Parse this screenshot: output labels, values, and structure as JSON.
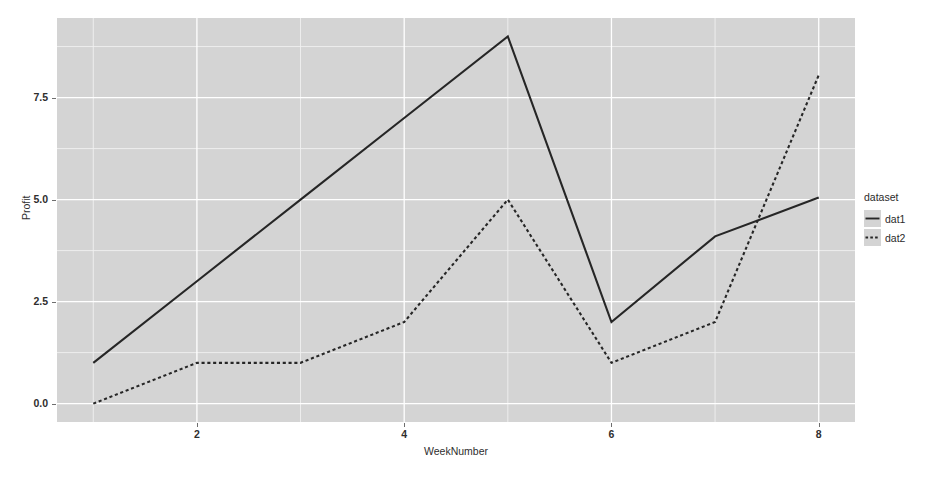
{
  "chart_data": {
    "type": "line",
    "title": "",
    "xlabel": "WeekNumber",
    "ylabel": "Profit",
    "x": [
      1,
      2,
      3,
      4,
      5,
      6,
      7,
      8
    ],
    "xlim": [
      0.65,
      8.35
    ],
    "ylim": [
      -0.45,
      9.45
    ],
    "xticks": [
      2,
      4,
      6,
      8
    ],
    "xticklabels": [
      "2",
      "4",
      "6",
      "8"
    ],
    "yticks": [
      0.0,
      2.5,
      5.0,
      7.5
    ],
    "yticklabels": [
      "0.0",
      "2.5",
      "5.0",
      "7.5"
    ],
    "grid": true,
    "grid_major_color": "#ffffff",
    "grid_minor_color": "#f0f0f0",
    "panel_background": "#d4d4d4",
    "legend_position": "right",
    "legend_title": "dataset",
    "series": [
      {
        "name": "dat1",
        "linestyle": "solid",
        "color": "#262626",
        "values": [
          1.0,
          3.0,
          5.0,
          7.0,
          9.0,
          2.0,
          4.1,
          5.05
        ]
      },
      {
        "name": "dat2",
        "linestyle": "dashed",
        "color": "#262626",
        "values": [
          0.0,
          1.0,
          1.0,
          2.0,
          5.0,
          1.0,
          2.0,
          8.05
        ]
      }
    ]
  },
  "axes": {
    "x_axis_label": "WeekNumber",
    "y_axis_label": "Profit"
  },
  "legend": {
    "title": "dataset",
    "entries": [
      {
        "label": "dat1",
        "style": "solid-line-key"
      },
      {
        "label": "dat2",
        "style": "dashed-line-key"
      }
    ]
  }
}
